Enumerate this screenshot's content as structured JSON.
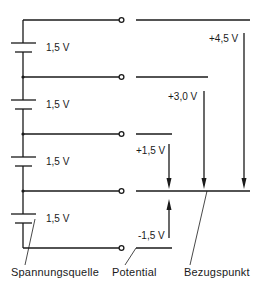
{
  "diagram": {
    "type": "voltage-potential-diagram",
    "cells": [
      {
        "label": "1,5 V"
      },
      {
        "label": "1,5 V"
      },
      {
        "label": "1,5 V"
      },
      {
        "label": "1,5 V"
      }
    ],
    "potentials": [
      {
        "label": "+4,5 V"
      },
      {
        "label": "+3,0 V"
      },
      {
        "label": "+1,5 V"
      },
      {
        "label": "-1,5 V"
      }
    ],
    "captions": {
      "source": "Spannungsquelle",
      "potential": "Potential",
      "reference": "Bezugspunkt"
    },
    "colors": {
      "line": "#1a1a1a",
      "background": "#ffffff"
    }
  }
}
